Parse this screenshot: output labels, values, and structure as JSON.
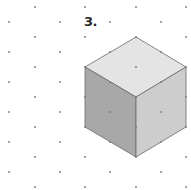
{
  "figure": {
    "label": "3.",
    "colors": {
      "top_face": "#e4e4e4",
      "left_face": "#a8a8a8",
      "right_face": "#cdcdcd",
      "edge": "#6a6a6a",
      "dot": "#7a7a7a"
    },
    "grid": {
      "columns_odd_x": [
        35,
        85,
        136,
        186
      ],
      "columns_odd_y": [
        7,
        37,
        67,
        97,
        127,
        157,
        187
      ],
      "columns_even_x": [
        9,
        60,
        110,
        161
      ],
      "columns_even_y": [
        22,
        52,
        82,
        112,
        142,
        172
      ]
    },
    "cube": {
      "top": [
        136,
        37
      ],
      "upper_left": [
        85,
        67
      ],
      "upper_right": [
        186,
        67
      ],
      "center": [
        136,
        97
      ],
      "lower_left": [
        85,
        127
      ],
      "lower_right": [
        186,
        127
      ],
      "bottom": [
        136,
        157
      ]
    }
  }
}
